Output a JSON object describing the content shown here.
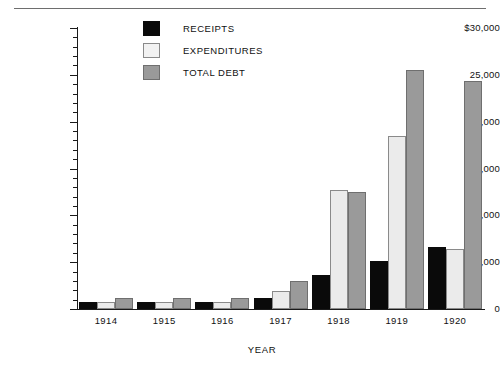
{
  "chart_data": {
    "type": "bar",
    "title": "",
    "xlabel": "YEAR",
    "ylabel": "$ MILLIONS",
    "categories": [
      "1914",
      "1915",
      "1916",
      "1917",
      "1918",
      "1919",
      "1920"
    ],
    "series": [
      {
        "name": "RECEIPTS",
        "color": "#0a0a0a",
        "values": [
          735,
          698,
          783,
          1124,
          3645,
          5130,
          6649
        ]
      },
      {
        "name": "EXPENDITURES",
        "color": "#ebebeb",
        "values": [
          735,
          746,
          734,
          1954,
          12677,
          18493,
          6358
        ]
      },
      {
        "name": "TOTAL DEBT",
        "color": "#9a9a9a",
        "values": [
          1188,
          1191,
          1225,
          2976,
          12455,
          25485,
          24299
        ]
      }
    ],
    "ylim": [
      0,
      30000
    ],
    "y_major_ticks": [
      0,
      5000,
      10000,
      15000,
      20000,
      25000,
      30000
    ],
    "y_tick_labels": [
      "0",
      "5,000",
      "10,000",
      "15,000",
      "20,000",
      "25,000",
      "$30,000"
    ],
    "y_minor_tick_step": 1000,
    "grid": false,
    "legend_position": "top-center"
  },
  "legend": {
    "items": [
      {
        "label": "RECEIPTS",
        "swatch": "receipts"
      },
      {
        "label": "EXPENDITURES",
        "swatch": "expenditures"
      },
      {
        "label": "TOTAL DEBT",
        "swatch": "debt"
      }
    ]
  }
}
